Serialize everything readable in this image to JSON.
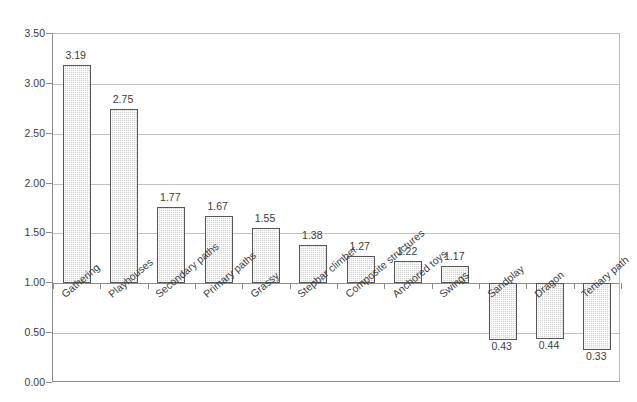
{
  "chart_data": {
    "type": "bar",
    "title": "",
    "subtitle": "",
    "xlabel": "",
    "ylabel": "",
    "ylim": [
      0.0,
      3.5
    ],
    "baseline": 1.0,
    "grid": true,
    "legend": "none",
    "ytick_labels": [
      "3.50",
      "3.00",
      "2.50",
      "2.00",
      "1.50",
      "1.00",
      "0.50",
      "0.00"
    ],
    "ytick_values": [
      3.5,
      3.0,
      2.5,
      2.0,
      1.5,
      1.0,
      0.5,
      0.0
    ],
    "categories": [
      "Gathering",
      "Playhouses",
      "Secondary paths",
      "Primary paths",
      "Grassy",
      "Stepbar climber",
      "Composite structures",
      "Anchored toys",
      "Swings",
      "Sandplay",
      "Dragon",
      "Tertiary path"
    ],
    "values": [
      3.19,
      2.75,
      1.77,
      1.67,
      1.55,
      1.38,
      1.27,
      1.22,
      1.17,
      0.43,
      0.44,
      0.33
    ],
    "value_labels": [
      "3.19",
      "2.75",
      "1.77",
      "1.67",
      "1.55",
      "1.38",
      "1.27",
      "1.22",
      "1.17",
      "0.43",
      "0.44",
      "0.33"
    ],
    "colors": {
      "bar_fill": "#d2d2d2",
      "bar_border": "#565656",
      "gridline": "#c2c2c2",
      "axis": "#8d8d8d",
      "text": "#3b3b3b",
      "background": "#ffffff"
    }
  }
}
